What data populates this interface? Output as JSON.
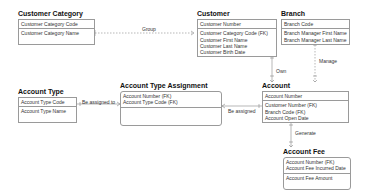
{
  "entities": {
    "customer_category": {
      "title": "Customer Category",
      "pk": [
        "Customer Category Code"
      ],
      "attrs": [
        "Customer Category Name"
      ]
    },
    "customer": {
      "title": "Customer",
      "pk": [
        "Customer Number"
      ],
      "attrs": [
        "Customer Category Code (FK)",
        "Customer First Name",
        "Customer Last Name",
        "Customer Birth Date"
      ]
    },
    "branch": {
      "title": "Branch",
      "pk": [
        "Branch Code"
      ],
      "attrs": [
        "Branch Manager First Name",
        "Branch Manager Last Name"
      ]
    },
    "account_type": {
      "title": "Account Type",
      "pk": [
        "Account Type Code"
      ],
      "attrs": [
        "Account Type Name"
      ]
    },
    "account_type_assignment": {
      "title": "Account Type Assignment",
      "pk": [
        "Account Number (FK)",
        "Account Type Code (FK)"
      ],
      "attrs": []
    },
    "account": {
      "title": "Account",
      "pk": [
        "Account Number"
      ],
      "attrs": [
        "Customer Number (FK)",
        "Branch Code (FK)",
        "Account Open Date"
      ]
    },
    "account_fee": {
      "title": "Account Fee",
      "pk": [
        "Account Number (FK)",
        "Account Fee Incurred Date"
      ],
      "attrs": [
        "Account Fee Amount"
      ]
    }
  },
  "relationships": {
    "group": "Group",
    "own": "Own",
    "manage": "Manage",
    "be_assigned_to": "Be assigned to",
    "be_assigned": "Be assigned",
    "generate": "Generate"
  },
  "colors": {
    "border": "#9a9a9a",
    "line": "#888888"
  }
}
